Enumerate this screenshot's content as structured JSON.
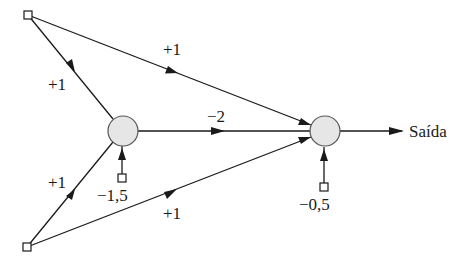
{
  "diagram": {
    "type": "neural-network",
    "colors": {
      "line": "#1a1a1a",
      "neuron_fill": "#e6e6e6",
      "neuron_stroke": "#555555",
      "terminal_fill": "#ffffff"
    },
    "nodes": {
      "input_top": {
        "kind": "input",
        "shape": "square"
      },
      "input_bottom": {
        "kind": "input",
        "shape": "square"
      },
      "hidden": {
        "kind": "neuron",
        "shape": "circle"
      },
      "output": {
        "kind": "neuron",
        "shape": "circle"
      },
      "bias_hidden": {
        "kind": "bias",
        "shape": "square",
        "value": "−1,5"
      },
      "bias_output": {
        "kind": "bias",
        "shape": "square",
        "value": "−0,5"
      }
    },
    "edges": [
      {
        "from": "input_top",
        "to": "output",
        "weight": "+1"
      },
      {
        "from": "input_top",
        "to": "hidden",
        "weight": "+1"
      },
      {
        "from": "input_bottom",
        "to": "hidden",
        "weight": "+1"
      },
      {
        "from": "input_bottom",
        "to": "output",
        "weight": "+1"
      },
      {
        "from": "hidden",
        "to": "output",
        "weight": "−2"
      },
      {
        "from": "bias_hidden",
        "to": "hidden",
        "weight": "−1,5"
      },
      {
        "from": "bias_output",
        "to": "output",
        "weight": "−0,5"
      }
    ],
    "output_label": "Saída"
  }
}
